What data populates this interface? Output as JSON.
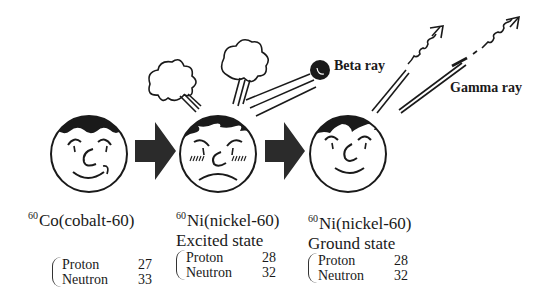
{
  "rays": {
    "beta_label": "Beta ray",
    "gamma_label": "Gamma ray"
  },
  "stages": [
    {
      "mass_number": "60",
      "name": "Co(cobalt-60)",
      "state": "",
      "proton_label": "Proton",
      "proton_count": "27",
      "neutron_label": "Neutron",
      "neutron_count": "33",
      "expression": "smiling"
    },
    {
      "mass_number": "60",
      "name": "Ni(nickel-60)",
      "state": "Excited state",
      "proton_label": "Proton",
      "proton_count": "28",
      "neutron_label": "Neutron",
      "neutron_count": "32",
      "expression": "angry"
    },
    {
      "mass_number": "60",
      "name": "Ni(nickel-60)",
      "state": "Ground state",
      "proton_label": "Proton",
      "proton_count": "28",
      "neutron_label": "Neutron",
      "neutron_count": "32",
      "expression": "calm-smiling"
    }
  ],
  "colors": {
    "ink": "#1a1a1a",
    "arrow": "#2b2b2b",
    "background": "#ffffff"
  }
}
